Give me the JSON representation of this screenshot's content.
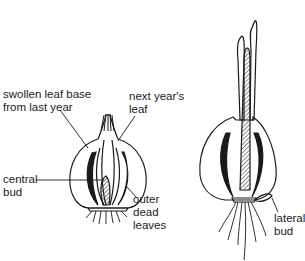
{
  "diagram": {
    "left_bulb": {
      "labels": {
        "swollen_leaf_base": [
          "swollen leaf base",
          "from last year"
        ],
        "next_years_leaf": [
          "next year's",
          "leaf"
        ],
        "central_bud": [
          "central",
          "bud"
        ],
        "outer_dead_leaves": [
          "outer",
          "dead",
          "leaves"
        ]
      }
    },
    "right_bulb": {
      "labels": {
        "lateral_bud": [
          "lateral",
          "bud"
        ]
      }
    },
    "colors": {
      "ink": "#1a1a1a",
      "background": "#ffffff"
    }
  }
}
